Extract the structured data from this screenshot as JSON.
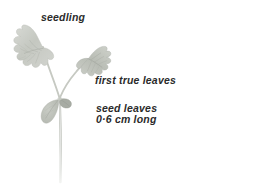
{
  "figure": {
    "background_color": "#ffffff",
    "width": 257,
    "height": 195
  },
  "labels": {
    "seedling": "seedling",
    "first_true_leaves": "first true leaves",
    "seed_leaves_line1": "seed leaves",
    "seed_leaves_line2": "0·6 cm long"
  },
  "specimen": {
    "name": "seedling-plant",
    "parts": [
      {
        "name": "true-leaf-left",
        "label": "first true leaf (left)"
      },
      {
        "name": "true-leaf-right",
        "label": "first true leaf (right)"
      },
      {
        "name": "seed-leaf-left",
        "label": "seed leaf (cotyledon, left)"
      },
      {
        "name": "seed-leaf-right",
        "label": "seed leaf (cotyledon, right)"
      },
      {
        "name": "stem",
        "label": "stem"
      }
    ],
    "colors": {
      "leaf_fill": "#c9ccc6",
      "leaf_vein": "#a8aca4",
      "leaf_edge": "#b4b8b0",
      "stem": "#c3c6bf",
      "cotyledon_fill": "#c0c3bc",
      "cotyledon_dark": "#9ea29a"
    }
  }
}
